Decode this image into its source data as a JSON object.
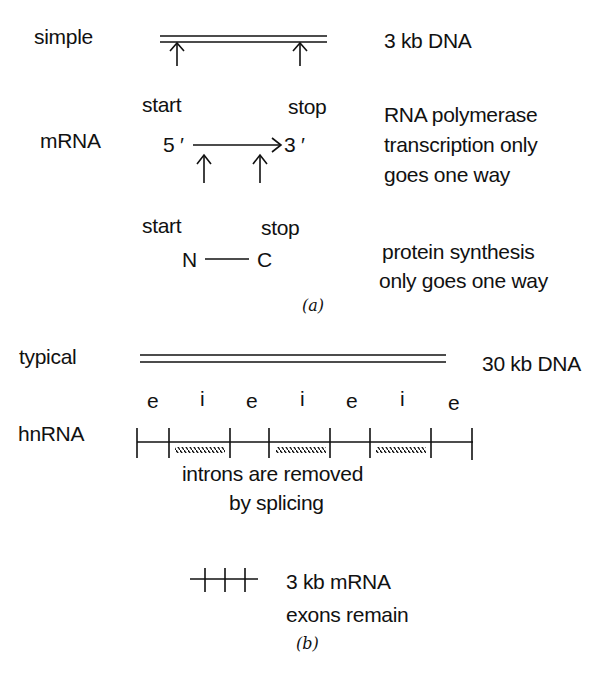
{
  "panel_a": {
    "simple": {
      "label": "simple",
      "dna_label": "3 kb DNA"
    },
    "mrna": {
      "label": "mRNA",
      "start": "start",
      "stop": "stop",
      "five_prime": "5 ′",
      "three_prime": "3 ′",
      "note_line1": "RNA polymerase",
      "note_line2": "transcription only",
      "note_line3": "goes one way"
    },
    "protein": {
      "start": "start",
      "stop": "stop",
      "n_term": "N",
      "c_term": "C",
      "note_line1": "protein synthesis",
      "note_line2": "only goes one way"
    },
    "caption": "(a)"
  },
  "panel_b": {
    "typical": {
      "label": "typical",
      "dna_label": "30 kb DNA"
    },
    "hnrna": {
      "label": "hnRNA",
      "segments": [
        "e",
        "i",
        "e",
        "i",
        "e",
        "i",
        "e"
      ]
    },
    "splicing_note_line1": "introns are removed",
    "splicing_note_line2": "by splicing",
    "mrna_line1": "3 kb mRNA",
    "mrna_line2": "exons remain",
    "caption": "(b)"
  }
}
